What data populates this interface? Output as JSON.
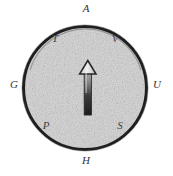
{
  "figure": {
    "background_color": "#ffffff",
    "circle": {
      "fill_color": "#d6d6d6",
      "stroke_color": "#1f1f1f",
      "center_x": 85,
      "center_y": 88,
      "radius": 62,
      "stroke_width": 3,
      "inner_arc_color": "#6b6b6b"
    },
    "needle": {
      "name": "compass-needle",
      "direction": "up",
      "head_fill": "#e8e8e8",
      "head_stroke": "#2b2b2b",
      "shaft_top_color": "#9a9a9a",
      "shaft_bottom_color": "#1c1c1c",
      "tip_x": 88,
      "tip_y": 61,
      "tail_y": 115
    },
    "labels": [
      {
        "id": "A",
        "text": "A",
        "position": "top-outside"
      },
      {
        "id": "T",
        "text": "T",
        "position": "upper-left-inside"
      },
      {
        "id": "V",
        "text": "V",
        "position": "upper-right-inside"
      },
      {
        "id": "G",
        "text": "G",
        "position": "left-outside"
      },
      {
        "id": "U",
        "text": "U",
        "position": "right-outside"
      },
      {
        "id": "P",
        "text": "P",
        "position": "lower-left-inside"
      },
      {
        "id": "S",
        "text": "S",
        "position": "lower-right-inside"
      },
      {
        "id": "H",
        "text": "H",
        "position": "bottom-outside"
      }
    ]
  }
}
